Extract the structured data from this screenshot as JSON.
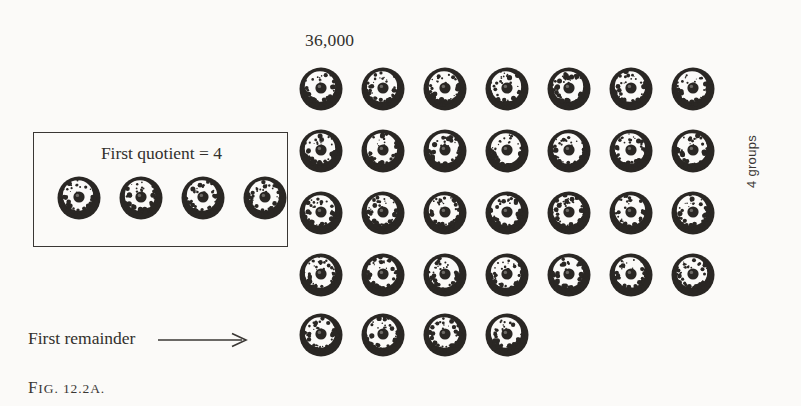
{
  "figure": {
    "caption_prefix": "F",
    "caption_text": "IG. 12.2A.",
    "caption_full": "FIG. 12.2A."
  },
  "total": {
    "label": "36,000"
  },
  "quotient_box": {
    "label": "First quotient = 4",
    "bead_count": 4
  },
  "remainder": {
    "label": "First remainder",
    "arrow_icon": "long-right-arrow-icon",
    "bead_count": 4
  },
  "groups": {
    "label": "4 groups",
    "count": 4
  },
  "main_grid": {
    "rows": 4,
    "columns": 7,
    "bead_count": 28
  },
  "colors": {
    "background": "#fbfaf8",
    "ink": "#2a2724",
    "ink_light": "#32302c",
    "border": "#3a3734"
  },
  "chart_data": {
    "type": "table",
    "title": "36,000",
    "xlabel": "",
    "ylabel": "4 groups",
    "categories": [
      "Row 1",
      "Row 2",
      "Row 3",
      "Row 4",
      "Remainder"
    ],
    "values": [
      7,
      7,
      7,
      7,
      4
    ],
    "annotations": [
      "36,000",
      "First quotient = 4",
      "First remainder",
      "4 groups",
      "FIG. 12.2A."
    ],
    "legend": []
  }
}
